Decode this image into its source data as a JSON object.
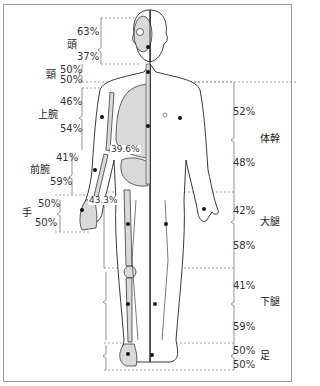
{
  "diagram": {
    "colors": {
      "line": "#222222",
      "dashed": "#888888",
      "bone": "#d9d9d9",
      "frame": "#9a9a9a",
      "text": "#333333"
    },
    "left_segments": [
      {
        "name": "頭",
        "top_pct": "63%",
        "bottom_pct": "37%"
      },
      {
        "name": "頸",
        "top_pct": "50%",
        "bottom_pct": "50%"
      },
      {
        "name": "上腕",
        "top_pct": "46%",
        "bottom_pct": "54%"
      },
      {
        "name": "前腕",
        "top_pct": "41%",
        "bottom_pct": "59%"
      },
      {
        "name": "手",
        "top_pct": "50%",
        "bottom_pct": "50%"
      }
    ],
    "right_segments": [
      {
        "name": "体幹",
        "top_pct": "52%",
        "bottom_pct": "48%"
      },
      {
        "name": "大腿",
        "top_pct": "42%",
        "bottom_pct": "58%"
      },
      {
        "name": "下腿",
        "top_pct": "41%",
        "bottom_pct": "59%"
      },
      {
        "name": "足",
        "top_pct": "50%",
        "bottom_pct": "50%"
      }
    ],
    "inner_labels": {
      "trunk_upper": "39.6%",
      "hip": "43.3%"
    }
  }
}
